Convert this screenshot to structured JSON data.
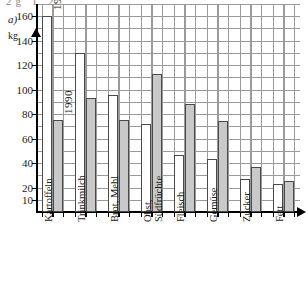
{
  "panel": {
    "label": "a)",
    "top_fragment": "2g  1  2"
  },
  "chart_data": {
    "type": "bar",
    "title": "",
    "xlabel": "",
    "ylabel": "kg",
    "ylim": [
      0,
      170
    ],
    "grid": true,
    "legend_position": "in-bar annotations",
    "categories": [
      "Kartoffeln",
      "Trinkmilch",
      "Brot, Mehl",
      "Obst, Südfrüchte",
      "Fleisch",
      "Gemüse",
      "Zucker",
      "Fett"
    ],
    "category_lines": [
      [
        "Kartoffeln"
      ],
      [
        "Trinkmilch"
      ],
      [
        "Brot, Mehl"
      ],
      [
        "Obst,",
        "Südfrüchte"
      ],
      [
        "Fleisch"
      ],
      [
        "Gemüse"
      ],
      [
        "Zucker"
      ],
      [
        "Fett"
      ]
    ],
    "series": [
      {
        "name": "1955",
        "color": "#ffffff",
        "values": [
          160,
          130,
          96,
          72,
          47,
          43,
          27,
          23
        ]
      },
      {
        "name": "1990",
        "color": "#c9c9c9",
        "values": [
          75,
          93,
          75,
          113,
          88,
          74,
          37,
          25
        ]
      }
    ],
    "ytick_labels": [
      "160",
      "140",
      "120",
      "100",
      "80",
      "60",
      "40",
      "20",
      "10"
    ],
    "ytick_values": [
      160,
      140,
      120,
      100,
      80,
      60,
      40,
      20,
      10
    ],
    "annotations": [
      {
        "text": "1955",
        "target": "Kartoffeln 1955 bar"
      },
      {
        "text": "1990",
        "target": "Kartoffeln 1990 bar"
      }
    ],
    "axis_unit": "kg"
  },
  "colors": {
    "bar_1955": "#ffffff",
    "bar_1990": "#c9c9c9",
    "bar_border": "#4a4a4a",
    "grid": "#9a9a9a",
    "axis": "#000000"
  }
}
